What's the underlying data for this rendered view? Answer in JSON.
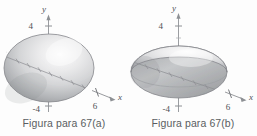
{
  "sheet": {
    "background": "#fdfdfd",
    "width": 257,
    "height": 136
  },
  "figures": [
    {
      "id": "figure-a",
      "caption": "Figura para 67(a)",
      "surface_kind": "ellipsoid",
      "axes": {
        "y_label": "y",
        "x_label": "x",
        "y_tick_positive": "4",
        "y_tick_negative": "-4",
        "x_tick": "6"
      },
      "colors": {
        "surface_light": "#fbfbfb",
        "surface_mid": "#c9c9cb",
        "surface_dark": "#8e9094",
        "outline": "#7f8185",
        "axis": "#8d9094",
        "text": "#4e5155"
      }
    },
    {
      "id": "figure-b",
      "caption": "Figura para 67(b)",
      "surface_kind": "oblate-ellipsoid",
      "axes": {
        "y_label": "y",
        "x_label": "x",
        "y_tick_positive": "4",
        "y_tick_negative": "-4",
        "x_tick": "6"
      },
      "colors": {
        "surface_light": "#fbfbfb",
        "surface_mid": "#c9c9cb",
        "surface_dark": "#8e9094",
        "outline": "#7f8185",
        "axis": "#8d9094",
        "text": "#4e5155"
      }
    }
  ]
}
